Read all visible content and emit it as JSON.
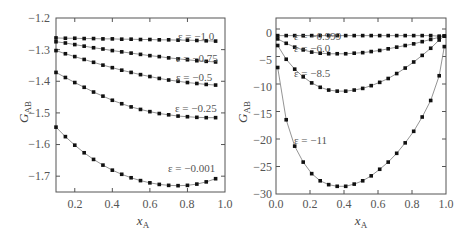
{
  "chart_data": [
    {
      "type": "line",
      "title": "",
      "xlabel": "x_A",
      "ylabel": "G_AB",
      "xlim": [
        0.1,
        1.0
      ],
      "ylim": [
        -1.75,
        -1.2
      ],
      "xticks": [
        "0.2",
        "0.4",
        "0.6",
        "0.8",
        "1.0"
      ],
      "yticks": [
        "-1.2",
        "-1.3",
        "-1.4",
        "-1.5",
        "-1.6",
        "-1.7"
      ],
      "grid": false,
      "legend": "inline annotations",
      "markers": "filled squares on lines",
      "x": [
        0.1,
        0.15,
        0.2,
        0.25,
        0.3,
        0.35,
        0.4,
        0.45,
        0.5,
        0.55,
        0.6,
        0.65,
        0.7,
        0.75,
        0.8,
        0.85,
        0.9,
        0.95
      ],
      "series": [
        {
          "name": "ε = −1.0",
          "values": [
            -1.263,
            -1.264,
            -1.264,
            -1.265,
            -1.265,
            -1.266,
            -1.266,
            -1.267,
            -1.267,
            -1.268,
            -1.268,
            -1.269,
            -1.269,
            -1.27,
            -1.27,
            -1.271,
            -1.272,
            -1.273
          ]
        },
        {
          "name": "ε = −0.75",
          "values": [
            -1.275,
            -1.279,
            -1.284,
            -1.289,
            -1.294,
            -1.298,
            -1.303,
            -1.307,
            -1.311,
            -1.315,
            -1.319,
            -1.322,
            -1.326,
            -1.329,
            -1.332,
            -1.335,
            -1.337,
            -1.339
          ]
        },
        {
          "name": "ε = −0.5",
          "values": [
            -1.303,
            -1.313,
            -1.322,
            -1.331,
            -1.34,
            -1.349,
            -1.357,
            -1.365,
            -1.372,
            -1.379,
            -1.385,
            -1.391,
            -1.396,
            -1.4,
            -1.404,
            -1.407,
            -1.41,
            -1.412
          ]
        },
        {
          "name": "ε = −0.25",
          "values": [
            -1.372,
            -1.388,
            -1.404,
            -1.419,
            -1.434,
            -1.447,
            -1.46,
            -1.471,
            -1.481,
            -1.489,
            -1.496,
            -1.502,
            -1.506,
            -1.51,
            -1.512,
            -1.514,
            -1.515,
            -1.515
          ]
        },
        {
          "name": "ε = −0.001",
          "values": [
            -1.545,
            -1.575,
            -1.602,
            -1.626,
            -1.647,
            -1.665,
            -1.681,
            -1.694,
            -1.705,
            -1.714,
            -1.721,
            -1.726,
            -1.729,
            -1.73,
            -1.729,
            -1.725,
            -1.718,
            -1.708
          ]
        }
      ]
    },
    {
      "type": "line",
      "title": "",
      "xlabel": "x_A",
      "ylabel": "G_AB",
      "xlim": [
        0.0,
        1.0
      ],
      "ylim": [
        -30,
        2
      ],
      "xticks": [
        "0.0",
        "0.2",
        "0.4",
        "0.6",
        "0.8",
        "1.0"
      ],
      "yticks": [
        "0",
        "-5",
        "-10",
        "-15",
        "-20",
        "-25",
        "-30"
      ],
      "grid": false,
      "legend": "inline annotations",
      "markers": "filled squares on lines",
      "x": [
        0.01,
        0.06,
        0.11,
        0.16,
        0.21,
        0.26,
        0.31,
        0.36,
        0.41,
        0.46,
        0.51,
        0.56,
        0.61,
        0.66,
        0.71,
        0.76,
        0.81,
        0.86,
        0.91,
        0.96,
        0.99
      ],
      "series": [
        {
          "name": "ε = −0.999",
          "values": [
            -1.2,
            -1.2,
            -1.2,
            -1.2,
            -1.2,
            -1.2,
            -1.2,
            -1.2,
            -1.2,
            -1.2,
            -1.2,
            -1.2,
            -1.2,
            -1.2,
            -1.2,
            -1.2,
            -1.2,
            -1.2,
            -1.2,
            -1.3,
            -1.3
          ]
        },
        {
          "name": "ε = −6.0",
          "values": [
            -1.8,
            -2.6,
            -3.3,
            -3.8,
            -4.2,
            -4.4,
            -4.5,
            -4.5,
            -4.5,
            -4.4,
            -4.3,
            -4.1,
            -3.9,
            -3.6,
            -3.3,
            -3.0,
            -2.7,
            -2.3,
            -1.9,
            -1.5,
            -1.3
          ]
        },
        {
          "name": "ε = −8.5",
          "values": [
            -3.0,
            -5.5,
            -7.3,
            -8.7,
            -9.8,
            -10.6,
            -11.1,
            -11.3,
            -11.3,
            -11.1,
            -10.8,
            -10.3,
            -9.7,
            -9.0,
            -8.1,
            -7.1,
            -6.0,
            -4.8,
            -3.5,
            -2.0,
            -1.3
          ]
        },
        {
          "name": "ε = −11",
          "values": [
            -7.0,
            -16.5,
            -21.3,
            -24.2,
            -26.3,
            -27.6,
            -28.3,
            -28.6,
            -28.6,
            -28.2,
            -27.6,
            -26.7,
            -25.5,
            -24.2,
            -22.6,
            -20.7,
            -18.6,
            -16.0,
            -13.0,
            -8.5,
            -3.2
          ]
        }
      ]
    }
  ],
  "left_panel": {
    "ylabel_main": "G",
    "ylabel_sub": "AB",
    "xlabel_main": "x",
    "xlabel_sub": "A",
    "yticks": [
      "−1.2",
      "−1.3",
      "−1.4",
      "−1.5",
      "−1.6",
      "−1.7"
    ],
    "xticks": [
      "0.2",
      "0.4",
      "0.6",
      "0.8",
      "1.0"
    ],
    "annotations": [
      "ε = −1.0",
      "ε = −0.75",
      "ε = −0.5",
      "ε = −0.25",
      "ε = −0.001"
    ]
  },
  "right_panel": {
    "ylabel_main": "G",
    "ylabel_sub": "AB",
    "xlabel_main": "x",
    "xlabel_sub": "A",
    "yticks": [
      "0",
      "−5",
      "−10",
      "−15",
      "−20",
      "−25",
      "−30"
    ],
    "xticks": [
      "0.0",
      "0.2",
      "0.4",
      "0.6",
      "0.8",
      "1.0"
    ],
    "annotations": [
      "ε = −0.999",
      "ε = −6.0",
      "ε = −8.5",
      "ε = −11"
    ]
  }
}
